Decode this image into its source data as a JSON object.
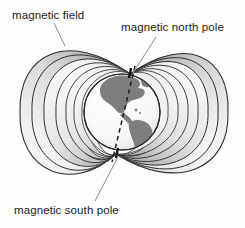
{
  "figure": {
    "type": "diagram",
    "background_color": "#fdfdfc",
    "width": 245,
    "height": 228
  },
  "labels": {
    "magnetic_field": "magnetic field",
    "magnetic_north_pole": "magnetic north pole",
    "magnetic_south_pole": "magnetic south pole"
  },
  "globe": {
    "name": "earth-globe",
    "center_x": 122,
    "center_y": 112,
    "radius": 38,
    "ocean_color": "#fbfbfb",
    "land_color": "#7e7e7e",
    "outline_color": "#2b2b2b",
    "visible_region": "the Americas"
  },
  "magnetic_axis": {
    "name": "magnetic-axis",
    "style": "dashed",
    "color": "#1f1f1f",
    "north_end_x": 135,
    "north_end_y": 66,
    "south_end_x": 112,
    "south_end_y": 162,
    "tilt_note": "axis tilted relative to vertical"
  },
  "field_lines": {
    "name": "magnetic-field-lines",
    "loop_count_per_side": 7,
    "line_color": "#2e2e2e",
    "shading_light": "#ffffff",
    "shading_dark": "#9a9a9a",
    "north_convergence_x": 130,
    "north_convergence_y": 74,
    "south_convergence_x": 116,
    "south_convergence_y": 154,
    "left_extent_x": 20,
    "right_extent_x": 230,
    "top_extent_y": 34,
    "bottom_extent_y": 192
  },
  "leader_lines": [
    {
      "name": "leader-magnetic-field",
      "x1": 54,
      "y1": 23,
      "x2": 65,
      "y2": 46
    },
    {
      "name": "leader-magnetic-north-pole",
      "x1": 156,
      "y1": 37,
      "x2": 133,
      "y2": 73
    },
    {
      "name": "leader-magnetic-south-pole",
      "x1": 118,
      "y1": 157,
      "x2": 95,
      "y2": 201
    }
  ],
  "pole_markers": {
    "north_marker_color": "#1a1a1a",
    "south_marker_color": "#1a1a1a"
  }
}
